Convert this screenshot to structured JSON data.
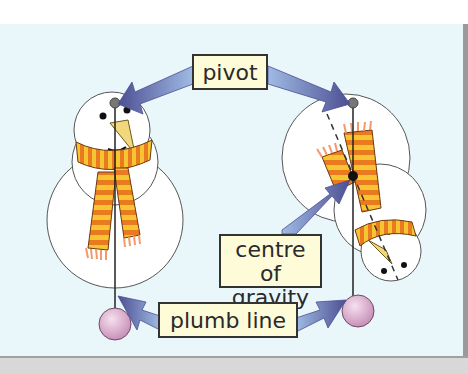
{
  "diagram": {
    "title": "",
    "labels": {
      "pivot": "pivot",
      "centre_of_gravity_line1": "centre",
      "centre_of_gravity_line2": "of gravity",
      "plumb_line": "plumb line"
    },
    "nodes": [
      {
        "id": "pivot",
        "text": "pivot"
      },
      {
        "id": "centre-of-gravity",
        "text": "centre of gravity"
      },
      {
        "id": "plumb-line",
        "text": "plumb line"
      },
      {
        "id": "snowman-upright",
        "text": ""
      },
      {
        "id": "snowman-tilted",
        "text": ""
      }
    ],
    "edges": [
      {
        "from": "pivot",
        "to": "snowman-upright pivot point"
      },
      {
        "from": "pivot",
        "to": "snowman-tilted pivot point"
      },
      {
        "from": "centre-of-gravity",
        "to": "snowman-tilted centre of gravity"
      },
      {
        "from": "plumb-line",
        "to": "snowman-upright plumb line"
      },
      {
        "from": "plumb-line",
        "to": "snowman-tilted plumb line"
      }
    ],
    "colors": {
      "background": "#e9f7fb",
      "label_fill": "#fdfbd8",
      "arrow": "#5a5f9e",
      "scarf_orange": "#e8711c",
      "scarf_yellow": "#f6c531",
      "plumb_bob": "#d9a9cc"
    }
  }
}
